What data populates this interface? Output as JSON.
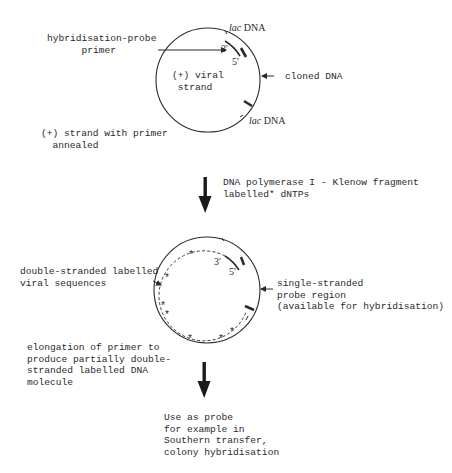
{
  "figure": {
    "step1": {
      "primer_label_line1": "hybridisation-probe",
      "primer_label_line2": "primer",
      "circle_label_line1": "(+) viral",
      "circle_label_line2": "strand",
      "lac_top_italic": "lac",
      "lac_top_rest": " DNA",
      "lac_bottom_italic": "lac",
      "lac_bottom_rest": " DNA",
      "cloned_label": "cloned DNA",
      "three_prime": "3'",
      "five_prime": "5'",
      "caption_line1": "(+) strand with primer",
      "caption_line2": "annealed"
    },
    "step2": {
      "reagent_line1": "DNA polymerase I - Klenow fragment",
      "reagent_line2": "labelled* dNTPs"
    },
    "step3": {
      "ds_label_line1": "double-stranded labelled",
      "ds_label_line2": "viral sequences",
      "ss_label_line1": "single-stranded",
      "ss_label_line2": "probe region",
      "ss_label_line3": "(available for hybridisation)",
      "three_prime": "3'",
      "five_prime": "5'",
      "caption_line1": "elongation of primer to",
      "caption_line2": "produce partially double-",
      "caption_line3": "stranded labelled DNA",
      "caption_line4": "molecule",
      "label_marker": "*"
    },
    "step4": {
      "use_line1": "Use as probe",
      "use_line2": "for example in",
      "use_line3": "Southern transfer,",
      "use_line4": "colony hybridisation"
    }
  },
  "colors": {
    "ink": "#2a2a2a",
    "background": "#ffffff"
  }
}
